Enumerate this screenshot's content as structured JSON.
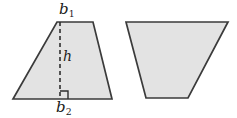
{
  "figure": {
    "name": "trapezoid-area-diagram",
    "background_color": "#ffffff",
    "shape_fill_color": "#e3e3e3",
    "shape_stroke_color": "#3b3b3b",
    "label_color": "#1a1a1a",
    "labels": {
      "top_base": {
        "symbol": "b",
        "subscript": "1",
        "text": "b1"
      },
      "bottom_base": {
        "symbol": "b",
        "subscript": "2",
        "text": "b2"
      },
      "height": {
        "symbol": "h",
        "subscript": "",
        "text": "h"
      }
    },
    "shapes": [
      {
        "name": "left-trapezoid",
        "type": "trapezoid",
        "orientation": "upright",
        "points": "57,22 93,22 112,99 13,99",
        "has_height_line": true,
        "has_right_angle_mark": true
      },
      {
        "name": "right-trapezoid",
        "type": "trapezoid",
        "orientation": "inverted",
        "points": "126,22 228,22 188,98 146,98",
        "has_height_line": false,
        "has_right_angle_mark": false
      }
    ],
    "height_line": {
      "name": "height-dashed-line",
      "x": 60,
      "y_top": 22,
      "y_bottom": 99,
      "dash_pattern": "4 3"
    },
    "right_angle_mark": {
      "name": "right-angle-marker",
      "points": "60,91 68,91 68,99"
    }
  }
}
